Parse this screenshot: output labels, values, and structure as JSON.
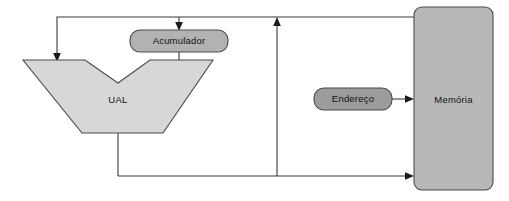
{
  "diagram": {
    "canvas": {
      "width": 509,
      "height": 201,
      "background": "#ffffff"
    },
    "nodes": {
      "ual": {
        "label": "UAL",
        "shape": "alu-trapezoid",
        "fill": "#d7d7d7",
        "stroke": "#4a4a4a",
        "label_x": 118,
        "label_y": 100
      },
      "acumulador": {
        "label": "Acumulador",
        "shape": "rounded-rect",
        "fill": "#b2b2b2",
        "stroke": "#4a4a4a",
        "x": 130,
        "y": 30,
        "width": 98,
        "height": 22,
        "radius": 10,
        "label_x": 179,
        "label_y": 41
      },
      "endereco": {
        "label": "Endereço",
        "shape": "rounded-rect",
        "fill": "#9c9c9c",
        "stroke": "#4a4a4a",
        "x": 314,
        "y": 88,
        "width": 78,
        "height": 22,
        "radius": 10,
        "label_x": 353,
        "label_y": 99
      },
      "memoria": {
        "label": "Memória",
        "shape": "rounded-rect",
        "fill": "#b8b8b8",
        "stroke": "#4a4a4a",
        "x": 414,
        "y": 7,
        "width": 79,
        "height": 183,
        "radius": 8,
        "label_x": 453,
        "label_y": 100
      }
    },
    "connections": [
      {
        "name": "memoria-to-acumulador-and-ual",
        "from": "memoria",
        "to": "acumulador",
        "path": "M 414 17 L 57 17 L 57 57",
        "arrow_at": "ual-top-left"
      },
      {
        "name": "top-bus-branch-to-acumulador",
        "from": "top-bus",
        "to": "acumulador",
        "path": "M 179 17 L 179 27",
        "arrow_at": "acumulador-top"
      },
      {
        "name": "acumulador-to-ual-right-input",
        "from": "acumulador",
        "to": "ual",
        "path": "M 179 52 L 179 61"
      },
      {
        "name": "ual-output-to-bottom-bus",
        "from": "ual",
        "to": "bottom-bus",
        "path": "M 118 133 L 118 176"
      },
      {
        "name": "bottom-bus-to-memoria",
        "from": "bottom-bus",
        "to": "memoria",
        "path": "M 118 176 L 409 176",
        "arrow_at": "memoria-left-bottom"
      },
      {
        "name": "bottom-bus-to-top-bus-riser",
        "from": "bottom-bus",
        "to": "top-bus",
        "path": "M 277 176 L 277 22",
        "arrow_at": "top-bus"
      },
      {
        "name": "endereco-to-memoria",
        "from": "endereco",
        "to": "memoria",
        "path": "M 392 99 L 409 99",
        "arrow_at": "memoria-left-middle"
      }
    ],
    "arrowheads": [
      {
        "name": "arrow-into-ual-top-left",
        "x": 57,
        "y": 60,
        "direction": "down"
      },
      {
        "name": "arrow-into-acumulador",
        "x": 179,
        "y": 30,
        "direction": "down"
      },
      {
        "name": "arrow-into-top-bus",
        "x": 277,
        "y": 17,
        "direction": "up"
      },
      {
        "name": "arrow-into-memoria-middle",
        "x": 414,
        "y": 99,
        "direction": "right"
      },
      {
        "name": "arrow-into-memoria-bottom",
        "x": 414,
        "y": 176,
        "direction": "right"
      }
    ]
  }
}
